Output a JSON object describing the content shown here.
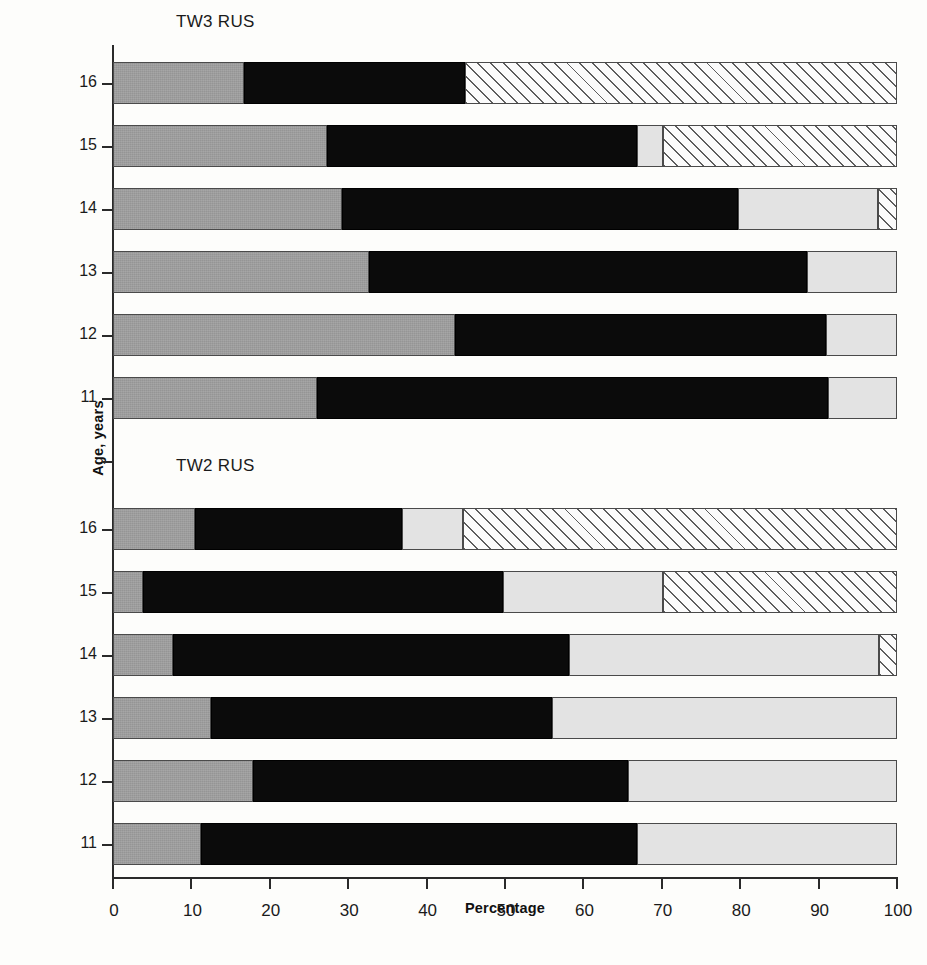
{
  "axes": {
    "y_title": "Age, years",
    "x_title": "Percentage",
    "x_ticks": [
      0,
      10,
      20,
      30,
      40,
      50,
      60,
      70,
      80,
      90,
      100
    ],
    "x_min": 0,
    "x_max": 100,
    "y_categories": [
      "16",
      "15",
      "14",
      "13",
      "12",
      "11"
    ]
  },
  "panels": [
    {
      "id": "tw3",
      "title": "TW3 RUS"
    },
    {
      "id": "tw2",
      "title": "TW2 RUS"
    }
  ],
  "colors": {
    "segment_gray": "#9d9d9d",
    "segment_black": "#0b0b0b",
    "segment_light_gray": "#e3e3e3",
    "segment_hatch": "#fbfbfb",
    "axis": "#2a2a2a"
  },
  "chart_data": {
    "type": "bar",
    "orientation": "horizontal",
    "stacked": true,
    "title": "",
    "xlabel": "Percentage",
    "ylabel": "Age, years",
    "xlim": [
      0,
      100
    ],
    "grid": false,
    "legend": "none",
    "categories": [
      "16",
      "15",
      "14",
      "13",
      "12",
      "11"
    ],
    "series": [
      {
        "name": "gray",
        "fill": "gray"
      },
      {
        "name": "black",
        "fill": "black"
      },
      {
        "name": "light-gray",
        "fill": "light-gray"
      },
      {
        "name": "hatched",
        "fill": "diagonal-hatch"
      }
    ],
    "panels": [
      {
        "name": "TW3 RUS",
        "bars": [
          {
            "category": "16",
            "segments": [
              {
                "series": "gray",
                "value": 16.7
              },
              {
                "series": "black",
                "value": 28.2
              },
              {
                "series": "light-gray",
                "value": 0
              },
              {
                "series": "hatched",
                "value": 55.1
              }
            ]
          },
          {
            "category": "15",
            "segments": [
              {
                "series": "gray",
                "value": 27.3
              },
              {
                "series": "black",
                "value": 39.5
              },
              {
                "series": "light-gray",
                "value": 3.3
              },
              {
                "series": "hatched",
                "value": 29.9
              }
            ]
          },
          {
            "category": "14",
            "segments": [
              {
                "series": "gray",
                "value": 29.2
              },
              {
                "series": "black",
                "value": 50.5
              },
              {
                "series": "light-gray",
                "value": 17.9
              },
              {
                "series": "hatched",
                "value": 2.4
              }
            ]
          },
          {
            "category": "13",
            "segments": [
              {
                "series": "gray",
                "value": 32.7
              },
              {
                "series": "black",
                "value": 55.8
              },
              {
                "series": "light-gray",
                "value": 11.5
              },
              {
                "series": "hatched",
                "value": 0
              }
            ]
          },
          {
            "category": "12",
            "segments": [
              {
                "series": "gray",
                "value": 43.6
              },
              {
                "series": "black",
                "value": 47.4
              },
              {
                "series": "light-gray",
                "value": 9.0
              },
              {
                "series": "hatched",
                "value": 0
              }
            ]
          },
          {
            "category": "11",
            "segments": [
              {
                "series": "gray",
                "value": 26.0
              },
              {
                "series": "black",
                "value": 65.2
              },
              {
                "series": "light-gray",
                "value": 8.8
              },
              {
                "series": "hatched",
                "value": 0
              }
            ]
          }
        ]
      },
      {
        "name": "TW2 RUS",
        "bars": [
          {
            "category": "16",
            "segments": [
              {
                "series": "gray",
                "value": 10.5
              },
              {
                "series": "black",
                "value": 26.4
              },
              {
                "series": "light-gray",
                "value": 7.7
              },
              {
                "series": "hatched",
                "value": 55.4
              }
            ]
          },
          {
            "category": "15",
            "segments": [
              {
                "series": "gray",
                "value": 3.8
              },
              {
                "series": "black",
                "value": 45.9
              },
              {
                "series": "light-gray",
                "value": 20.4
              },
              {
                "series": "hatched",
                "value": 29.9
              }
            ]
          },
          {
            "category": "14",
            "segments": [
              {
                "series": "gray",
                "value": 7.7
              },
              {
                "series": "black",
                "value": 50.5
              },
              {
                "series": "light-gray",
                "value": 39.5
              },
              {
                "series": "hatched",
                "value": 2.3
              }
            ]
          },
          {
            "category": "13",
            "segments": [
              {
                "series": "gray",
                "value": 12.5
              },
              {
                "series": "black",
                "value": 43.5
              },
              {
                "series": "light-gray",
                "value": 44.0
              },
              {
                "series": "hatched",
                "value": 0
              }
            ]
          },
          {
            "category": "12",
            "segments": [
              {
                "series": "gray",
                "value": 17.9
              },
              {
                "series": "black",
                "value": 47.8
              },
              {
                "series": "light-gray",
                "value": 34.3
              },
              {
                "series": "hatched",
                "value": 0
              }
            ]
          },
          {
            "category": "11",
            "segments": [
              {
                "series": "gray",
                "value": 11.2
              },
              {
                "series": "black",
                "value": 55.7
              },
              {
                "series": "light-gray",
                "value": 33.1
              },
              {
                "series": "hatched",
                "value": 0
              }
            ]
          }
        ]
      }
    ]
  }
}
